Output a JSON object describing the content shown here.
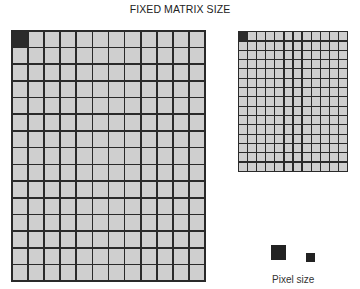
{
  "title": "FIXED MATRIX SIZE",
  "large_matrix": {
    "columns": 12,
    "rows": 15,
    "highlighted_cell": [
      0,
      0
    ],
    "box": {
      "left": 11,
      "top": 30,
      "width": 195,
      "height": 252,
      "gap": 1.6
    },
    "cell_color": "#cfcfcf",
    "line_color": "#2a2a2a",
    "highlight_color": "#2b2b2b"
  },
  "small_matrix": {
    "columns": 12,
    "rows": 15,
    "highlighted_cell": [
      0,
      0
    ],
    "box": {
      "left": 238,
      "top": 31,
      "width": 110,
      "height": 141,
      "gap": 1.2
    },
    "cell_color": "#cfcfcf",
    "line_color": "#2a2a2a",
    "highlight_color": "#2b2b2b"
  },
  "legend": {
    "label": "Pixel size",
    "large_pixel": {
      "left": 271,
      "top": 245,
      "size": 15
    },
    "small_pixel": {
      "left": 306,
      "top": 253,
      "size": 9
    }
  }
}
